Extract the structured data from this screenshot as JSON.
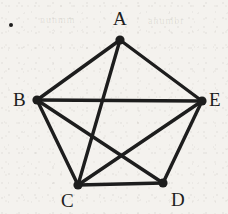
{
  "figure": {
    "type": "undirected-graph",
    "bullet": {
      "name": "list-bullet",
      "x": 9,
      "y": 23,
      "size": 4
    },
    "style": {
      "background_color": "#f4f2ee",
      "ink_color": "#1d1d1d",
      "edge_width": 3.4,
      "node_radius": 4.6,
      "label_font_size": 19
    },
    "vertices": [
      {
        "id": "A",
        "label": "A",
        "x": 120,
        "y": 40,
        "label_x": 113,
        "label_y": 9,
        "degree": 3
      },
      {
        "id": "B",
        "label": "B",
        "x": 37,
        "y": 100,
        "label_x": 13,
        "label_y": 90,
        "degree": 4
      },
      {
        "id": "C",
        "label": "C",
        "x": 78,
        "y": 185,
        "label_x": 61,
        "label_y": 191,
        "degree": 5
      },
      {
        "id": "D",
        "label": "D",
        "x": 163,
        "y": 183,
        "label_x": 171,
        "label_y": 190,
        "degree": 3
      },
      {
        "id": "E",
        "label": "E",
        "x": 202,
        "y": 101,
        "label_x": 209,
        "label_y": 90,
        "degree": 4
      }
    ],
    "edges": [
      {
        "from": "A",
        "to": "B"
      },
      {
        "from": "A",
        "to": "E"
      },
      {
        "from": "A",
        "to": "C"
      },
      {
        "from": "B",
        "to": "E"
      },
      {
        "from": "B",
        "to": "C"
      },
      {
        "from": "B",
        "to": "D"
      },
      {
        "from": "C",
        "to": "D"
      },
      {
        "from": "C",
        "to": "E"
      },
      {
        "from": "D",
        "to": "E"
      }
    ],
    "edge_count": 9,
    "vertex_count": 5,
    "ghost_marks": [
      {
        "text": "nunmm",
        "x": 40,
        "y": 14,
        "size": 10
      },
      {
        "text": "anumbr",
        "x": 148,
        "y": 15,
        "size": 10
      }
    ]
  }
}
